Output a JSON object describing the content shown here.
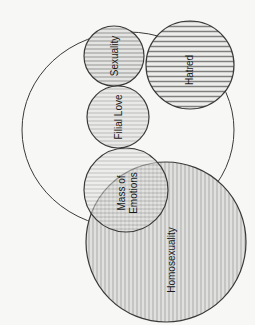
{
  "diagram": {
    "type": "venn",
    "colors": {
      "background": "#f7f7f5",
      "stroke": "#3a3a3a",
      "fill_light": "#e2e2e0",
      "hatch": "#9a9a98"
    },
    "outer_region": {
      "label": "",
      "shape": "ellipse",
      "cx": 128,
      "cy": 130,
      "rx": 106,
      "ry": 98
    },
    "circles": [
      {
        "id": "sexuality",
        "label": "Sexuality",
        "cx": 114,
        "cy": 56,
        "r": 30,
        "pattern": "horizontal"
      },
      {
        "id": "hatred",
        "label": "Hatred",
        "cx": 190,
        "cy": 65,
        "r": 44,
        "pattern": "horizontal-dense"
      },
      {
        "id": "filial-love",
        "label": "Filial Love",
        "cx": 118,
        "cy": 117,
        "r": 31,
        "pattern": "horizontal-faint"
      },
      {
        "id": "mass-of-emotions",
        "label_lines": [
          "Mass of",
          "Emotions"
        ],
        "cx": 126,
        "cy": 190,
        "r": 42,
        "pattern": "horizontal"
      },
      {
        "id": "homosexuality",
        "label": "Homosexuality",
        "cx": 166,
        "cy": 242,
        "r": 80,
        "pattern": "vertical"
      }
    ]
  }
}
